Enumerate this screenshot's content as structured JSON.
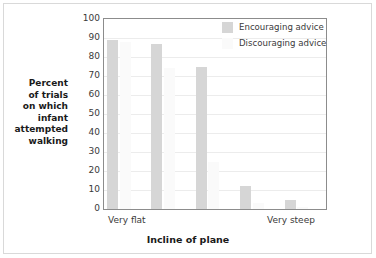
{
  "chart_data": {
    "type": "bar",
    "title": "",
    "xlabel": "Incline of plane",
    "ylabel": "Percent\nof trials\non which\ninfant\nattempted\nwalking",
    "ylim": [
      0,
      100
    ],
    "ytick_labels": [
      "100",
      "90",
      "80",
      "70",
      "60",
      "50",
      "40",
      "30",
      "20",
      "10",
      "0"
    ],
    "ytick_values": [
      100,
      90,
      80,
      70,
      60,
      50,
      40,
      30,
      20,
      10,
      0
    ],
    "xtick_labels": [
      "Very flat",
      "Very steep"
    ],
    "grid": true,
    "legend_position": "top-right",
    "categories": [
      "1",
      "2",
      "3",
      "4",
      "5"
    ],
    "series": [
      {
        "name": "Encouraging advice",
        "color": "#d6d6d6",
        "values": [
          89,
          87,
          75,
          12,
          5
        ]
      },
      {
        "name": "Discouraging advice",
        "color": "#fafafa",
        "values": [
          88,
          74,
          25,
          3,
          1
        ]
      }
    ]
  },
  "legend": {
    "items": [
      {
        "label": "Encouraging advice",
        "color": "#d6d6d6"
      },
      {
        "label": "Discouraging advice",
        "color": "#fafafa"
      }
    ]
  }
}
